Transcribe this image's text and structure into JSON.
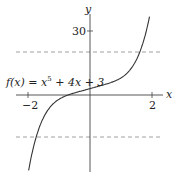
{
  "chart_data": {
    "type": "line",
    "title": "",
    "function_label": "f(x) = x^5 + 4x + 3",
    "xlabel": "x",
    "ylabel": "y",
    "xlim": [
      -2.2,
      2.2
    ],
    "ylim": [
      -37,
      38
    ],
    "x_ticks": [
      -2,
      2
    ],
    "x_tick_labels": [
      "−2",
      "2"
    ],
    "y_ticks": [
      30
    ],
    "y_tick_labels": [
      "30"
    ],
    "grid": false,
    "legend": null,
    "reference_lines": [
      {
        "y": 20,
        "style": "dashed"
      },
      {
        "y": -20,
        "style": "dashed"
      }
    ],
    "series": [
      {
        "name": "f(x) = x^5 + 4x + 3",
        "x": [
          -2.05,
          -2.0,
          -1.8,
          -1.6,
          -1.4,
          -1.2,
          -1.0,
          -0.8,
          -0.6,
          -0.4,
          -0.2,
          0,
          0.2,
          0.4,
          0.6,
          0.8,
          1.0,
          1.2,
          1.4,
          1.6,
          1.8,
          1.95
        ],
        "values": [
          -43.2,
          -37.0,
          -22.1,
          -13.9,
          -8.0,
          -4.3,
          -2.0,
          -0.5,
          0.5,
          1.4,
          2.2,
          3.0,
          3.8,
          4.6,
          5.5,
          6.5,
          8.0,
          10.3,
          14.0,
          19.9,
          29.1,
          38.0
        ]
      }
    ]
  },
  "labels": {
    "function": "f(x) = x",
    "function_exp": "5",
    "function_rest": " + 4x + 3",
    "x_axis": "x",
    "y_axis": "y",
    "tick_neg2": "−2",
    "tick_2": "2",
    "tick_30": "30"
  }
}
